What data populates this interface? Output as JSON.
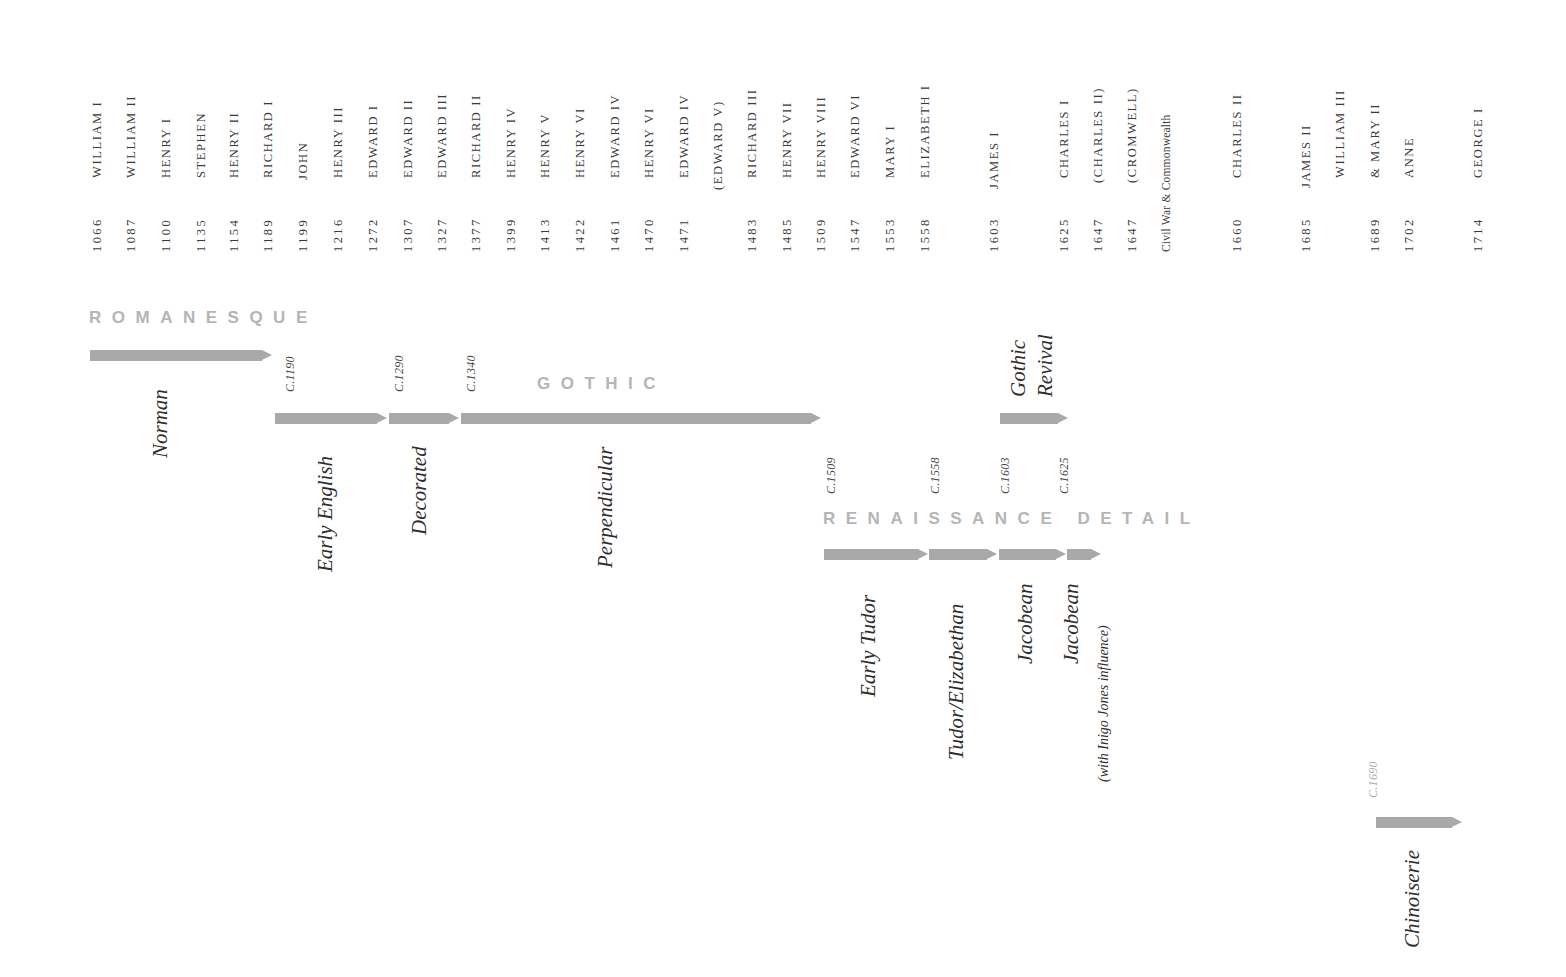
{
  "monarchs": [
    {
      "name": "WILLIAM I",
      "year": "1066"
    },
    {
      "name": "WILLIAM II",
      "year": "1087"
    },
    {
      "name": "HENRY I",
      "year": "1100"
    },
    {
      "name": "STEPHEN",
      "year": "1135"
    },
    {
      "name": "HENRY II",
      "year": "1154"
    },
    {
      "name": "RICHARD I",
      "year": "1189"
    },
    {
      "name": "JOHN",
      "year": "1199"
    },
    {
      "name": "HENRY III",
      "year": "1216"
    },
    {
      "name": "EDWARD I",
      "year": "1272"
    },
    {
      "name": "EDWARD II",
      "year": "1307"
    },
    {
      "name": "EDWARD III",
      "year": "1327"
    },
    {
      "name": "RICHARD II",
      "year": "1377"
    },
    {
      "name": "HENRY IV",
      "year": "1399"
    },
    {
      "name": "HENRY V",
      "year": "1413"
    },
    {
      "name": "HENRY VI",
      "year": "1422"
    },
    {
      "name": "EDWARD IV",
      "year": "1461"
    },
    {
      "name": "HENRY VI",
      "year": "1470"
    },
    {
      "name": "EDWARD IV",
      "year": "1471"
    },
    {
      "name": "(EDWARD V)",
      "year": ""
    },
    {
      "name": "RICHARD III",
      "year": "1483"
    },
    {
      "name": "HENRY VII",
      "year": "1485"
    },
    {
      "name": "HENRY VIII",
      "year": "1509"
    },
    {
      "name": "EDWARD VI",
      "year": "1547"
    },
    {
      "name": "MARY I",
      "year": "1553"
    },
    {
      "name": "ELIZABETH I",
      "year": "1558"
    },
    {
      "name": "JAMES I",
      "year": "1603"
    },
    {
      "name": "CHARLES I",
      "year": "1625"
    },
    {
      "name": "(CHARLES II)",
      "year": "1647"
    },
    {
      "name": "(CROMWELL)",
      "year": "1647"
    },
    {
      "name": "",
      "year": "Civil War & Commonwealth"
    },
    {
      "name": "CHARLES II",
      "year": "1660"
    },
    {
      "name": "JAMES II",
      "year": "1685"
    },
    {
      "name": "WILLIAM III",
      "year": ""
    },
    {
      "name": "& MARY II",
      "year": "1689"
    },
    {
      "name": "ANNE",
      "year": "1702"
    },
    {
      "name": "GEORGE I",
      "year": "1714"
    }
  ],
  "eras": {
    "romanesque": "ROMANESQUE",
    "gothic": "GOTHIC",
    "renaissance": "RENAISSANCE DETAIL"
  },
  "circa": {
    "c1190": "C.1190",
    "c1290": "C.1290",
    "c1340": "C.1340",
    "c1509": "C.1509",
    "c1558": "C.1558",
    "c1603": "C.1603",
    "c1625": "C.1625",
    "c1690": "C.1690"
  },
  "styles": {
    "norman": "Norman",
    "early_english": "Early English",
    "decorated": "Decorated",
    "perpendicular": "Perpendicular",
    "gothic_revival_1": "Gothic",
    "gothic_revival_2": "Revival",
    "early_tudor": "Early Tudor",
    "tudor_elizabethan": "Tudor/Elizabethan",
    "jacobean": "Jacobean",
    "jacobean_inigo": "Jacobean",
    "jacobean_inigo_sub": "(with Inigo Jones influence)",
    "chinoiserie": "Chinoiserie"
  },
  "colors": {
    "arrow": "#a9a9a9",
    "era_heading": "#b5b5b5",
    "text": "#333333"
  }
}
